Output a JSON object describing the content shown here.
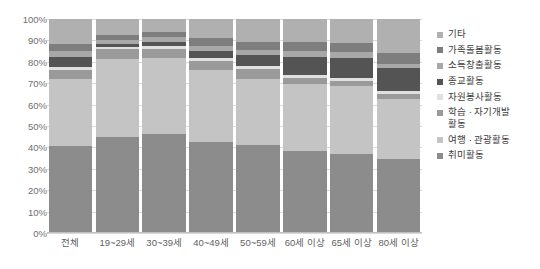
{
  "chart_data": {
    "type": "bar",
    "subtype": "stacked-100-percent",
    "title": "",
    "xlabel": "",
    "ylabel": "",
    "ylim": [
      0,
      100
    ],
    "yticks": [
      "0%",
      "10%",
      "20%",
      "30%",
      "40%",
      "50%",
      "60%",
      "70%",
      "80%",
      "90%",
      "100%"
    ],
    "grid": true,
    "legend_position": "right",
    "categories": [
      "전체",
      "19~29세",
      "30~39세",
      "40~49세",
      "50~59세",
      "60세 이상",
      "65세 이상",
      "80세 이상"
    ],
    "series": [
      {
        "name": "취미활동",
        "color": "#8c8c8c",
        "values": [
          40.5,
          45.0,
          46.5,
          42.5,
          41.0,
          38.5,
          37.0,
          34.5
        ]
      },
      {
        "name": "여행 · 관광활동",
        "color": "#c4c4c4",
        "values": [
          31.5,
          36.5,
          35.5,
          33.5,
          31.0,
          31.0,
          31.5,
          28.0
        ]
      },
      {
        "name": "학습 · 자기개발\n활동",
        "color": "#9a9a9a",
        "values": [
          4.0,
          4.5,
          4.0,
          4.5,
          4.5,
          3.0,
          2.5,
          2.5
        ]
      },
      {
        "name": "자원봉사활동",
        "color": "#e0e0e0",
        "values": [
          1.5,
          1.0,
          1.5,
          1.5,
          1.5,
          1.5,
          1.5,
          1.5
        ]
      },
      {
        "name": "종교활동",
        "color": "#545454",
        "values": [
          5.0,
          1.5,
          2.0,
          3.0,
          5.0,
          8.5,
          9.5,
          10.5
        ]
      },
      {
        "name": "소득창출활동",
        "color": "#a8a8a8",
        "values": [
          2.5,
          1.5,
          2.0,
          2.5,
          2.5,
          2.5,
          2.5,
          2.0
        ]
      },
      {
        "name": "가족돌봄활동",
        "color": "#7e7e7e",
        "values": [
          3.5,
          2.5,
          2.5,
          3.5,
          4.0,
          4.5,
          4.5,
          5.0
        ]
      },
      {
        "name": "기타",
        "color": "#b0b0b0",
        "values": [
          11.5,
          7.5,
          6.0,
          9.0,
          10.5,
          10.5,
          11.0,
          16.0
        ]
      }
    ],
    "legend_order_top_to_bottom": [
      "기타",
      "가족돌봄활동",
      "소득창출활동",
      "종교활동",
      "자원봉사활동",
      "학습 · 자기개발\n활동",
      "여행 · 관광활동",
      "취미활동"
    ]
  },
  "legend": {
    "items": [
      {
        "label": "기타",
        "color": "#b0b0b0"
      },
      {
        "label": "가족돌봄활동",
        "color": "#7e7e7e"
      },
      {
        "label": "소득창출활동",
        "color": "#a8a8a8"
      },
      {
        "label": "종교활동",
        "color": "#545454"
      },
      {
        "label": "자원봉사활동",
        "color": "#e0e0e0"
      },
      {
        "label": "학습 · 자기개발\n활동",
        "color": "#9a9a9a"
      },
      {
        "label": "여행 · 관광활동",
        "color": "#c4c4c4"
      },
      {
        "label": "취미활동",
        "color": "#8c8c8c"
      }
    ]
  }
}
